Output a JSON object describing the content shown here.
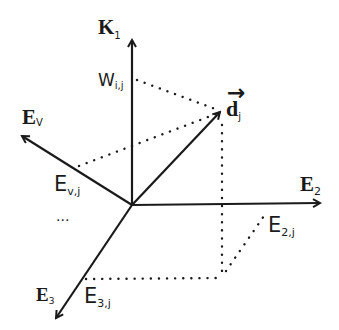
{
  "diagram": {
    "axes": [
      {
        "id": "K1",
        "label": "K",
        "subscript": "1",
        "style": "bold-serif"
      },
      {
        "id": "Ev",
        "label": "E",
        "subscript": "V",
        "style": "bold-serif"
      },
      {
        "id": "E2",
        "label": "E",
        "subscript": "2",
        "style": "bold-serif"
      },
      {
        "id": "E3",
        "label": "E",
        "subscript": "3",
        "style": "bold-serif"
      }
    ],
    "vector": {
      "label": "d",
      "subscript": "j",
      "arrow_accent": "→"
    },
    "projections": [
      {
        "id": "w",
        "label": "W",
        "subscript": "i,j"
      },
      {
        "id": "ev",
        "label": "E",
        "subscript": "v,j"
      },
      {
        "id": "e2",
        "label": "E",
        "subscript": "2,j"
      },
      {
        "id": "e3",
        "label": "E",
        "subscript": "3,j"
      }
    ],
    "ellipsis": "...",
    "colors": {
      "line": "#1a1a1a",
      "background": "#ffffff"
    }
  }
}
